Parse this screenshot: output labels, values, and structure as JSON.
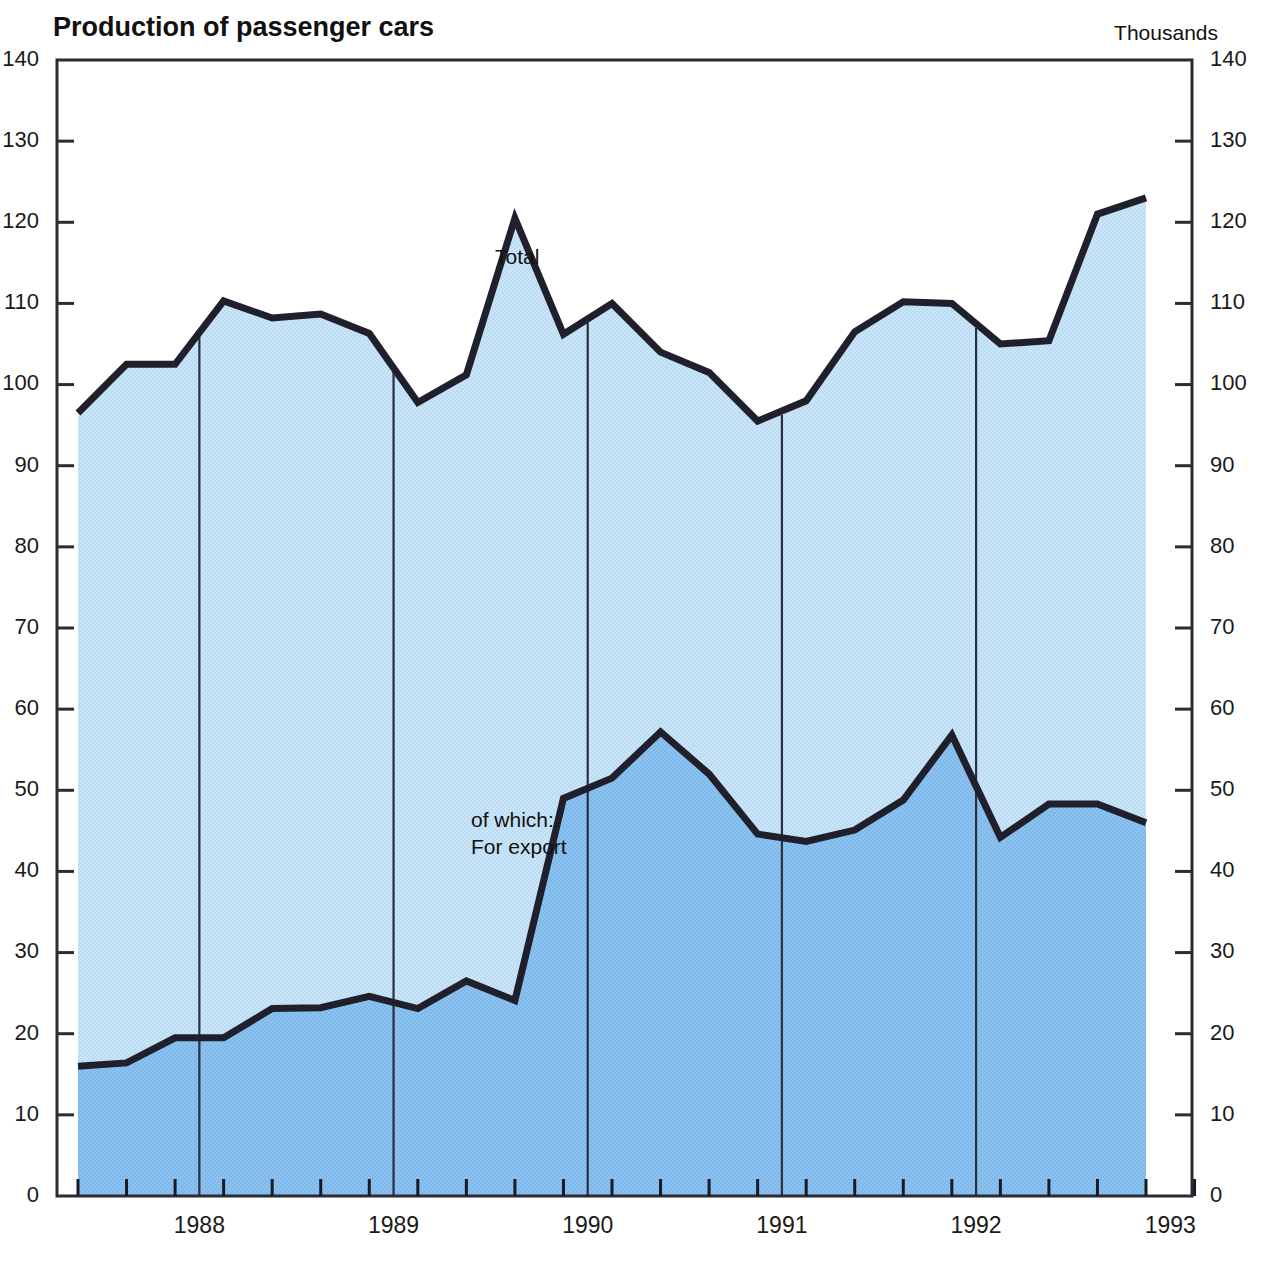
{
  "header": {
    "title": "Production of passenger cars",
    "unit_label": "Thousands"
  },
  "axes": {
    "y_left_ticks": [
      "140",
      "130",
      "120",
      "110",
      "100",
      "90",
      "80",
      "70",
      "60",
      "50",
      "40",
      "30",
      "20",
      "10",
      "0"
    ],
    "y_right_ticks": [
      "140",
      "130",
      "120",
      "110",
      "100",
      "90",
      "80",
      "70",
      "60",
      "50",
      "40",
      "30",
      "20",
      "10",
      "0"
    ],
    "x_year_labels": [
      "1988",
      "1989",
      "1990",
      "1991",
      "1992",
      "1993"
    ]
  },
  "annotations": {
    "total_label": "Total",
    "export_label_line1": "of which:",
    "export_label_line2": "For export"
  },
  "colors": {
    "total_area": "#b9dbf4",
    "export_area": "#7fb9ea",
    "line": "#20202c",
    "frame": "#2b2b33",
    "text": "#1a1a1a",
    "background": "#ffffff"
  },
  "chart_data": {
    "type": "area",
    "title": "Production of passenger cars",
    "subtitle": "",
    "xlabel": "",
    "ylabel": "Thousands",
    "ylim": [
      0,
      140
    ],
    "ytick_step": 10,
    "grid": false,
    "legend_position": "inline-annotation",
    "x_unit": "quarter",
    "x": [
      "1987Q4",
      "1988Q1",
      "1988Q2",
      "1988Q3",
      "1988Q4",
      "1989Q1",
      "1989Q2",
      "1989Q3",
      "1989Q4",
      "1990Q1",
      "1990Q2",
      "1990Q3",
      "1990Q4",
      "1991Q1",
      "1991Q2",
      "1991Q3",
      "1991Q4",
      "1992Q1",
      "1992Q2",
      "1992Q3",
      "1992Q4",
      "1993Q1",
      "1993Q2"
    ],
    "series": [
      {
        "name": "Total",
        "values": [
          96.5,
          102.5,
          102.5,
          110.3,
          108.2,
          108.7,
          106.3,
          97.8,
          101.2,
          120.5,
          106.2,
          110.0,
          104.0,
          101.5,
          95.5,
          98.0,
          106.5,
          110.2,
          110.0,
          105.0,
          105.4,
          121.0,
          123.0
        ]
      },
      {
        "name": "of which: For export",
        "values": [
          16.0,
          16.4,
          19.5,
          19.5,
          23.1,
          23.2,
          24.6,
          23.1,
          26.5,
          24.1,
          49.0,
          51.5,
          57.2,
          52.0,
          44.6,
          43.7,
          45.1,
          48.8,
          56.8,
          44.2,
          48.3,
          48.3,
          46.0
        ]
      }
    ],
    "annotations": [
      {
        "text": "Total",
        "x": "1989Q4",
        "y": 114
      },
      {
        "text": "of which: For export",
        "x": "1989Q3",
        "y": 46
      }
    ]
  },
  "geometry": {
    "plot_left": 57,
    "plot_right": 1192,
    "plot_top": 60,
    "plot_bottom": 1196,
    "data_left": 78,
    "data_right": 1146
  }
}
